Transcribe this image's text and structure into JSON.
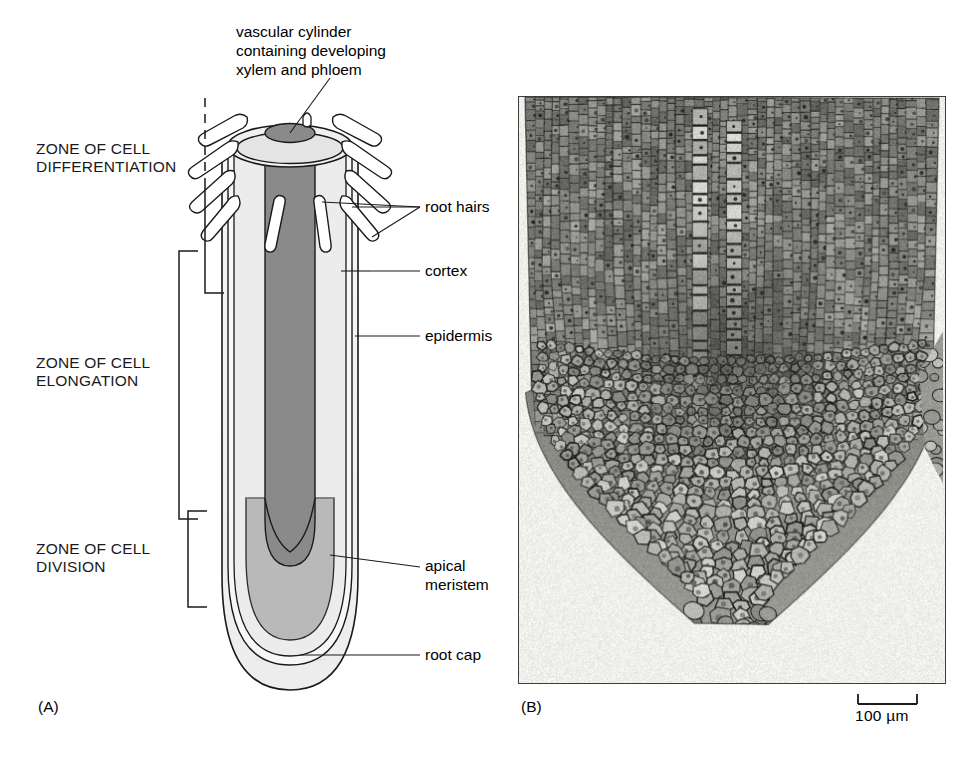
{
  "figure": {
    "panels": [
      {
        "id": "A",
        "letter": "(A)",
        "kind": "diagram"
      },
      {
        "id": "B",
        "letter": "(B)",
        "kind": "micrograph"
      }
    ]
  },
  "panel_a": {
    "zones": [
      {
        "name": "differentiation",
        "label": "ZONE OF CELL\nDIFFERENTIATION"
      },
      {
        "name": "elongation",
        "label": "ZONE OF CELL\nELONGATION"
      },
      {
        "name": "division",
        "label": "ZONE OF CELL\nDIVISION"
      }
    ],
    "callouts": [
      {
        "name": "vascular-cylinder",
        "label": "vascular cylinder\ncontaining developing\nxylem and phloem"
      },
      {
        "name": "root-hairs",
        "label": "root hairs"
      },
      {
        "name": "cortex",
        "label": "cortex"
      },
      {
        "name": "epidermis",
        "label": "epidermis"
      },
      {
        "name": "apical-meristem",
        "label": "apical\nmeristem"
      },
      {
        "name": "root-cap",
        "label": "root cap"
      }
    ],
    "letter": "(A)"
  },
  "panel_b": {
    "letter": "(B)",
    "scale_bar": {
      "label": "100 µm"
    }
  },
  "colors": {
    "background": "#ffffff",
    "ink": "#000000",
    "vascular_cylinder": "#8a8a8a",
    "apical_meristem": "#b9b9b9",
    "cortex": "#ececec",
    "root_cap": "#f2f2f2",
    "micrograph_border": "#3d3d3d",
    "micrograph_bg": "#efefec"
  }
}
